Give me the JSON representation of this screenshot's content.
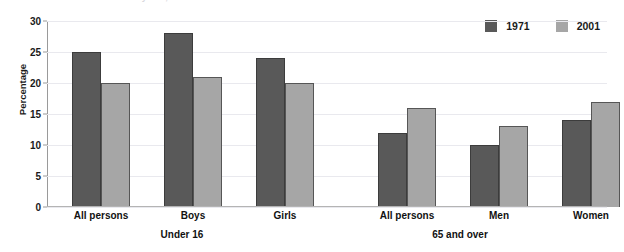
{
  "chart_data": {
    "type": "bar",
    "title": "",
    "xlabel": "",
    "ylabel": "Percentage",
    "ylim": [
      0,
      30
    ],
    "yticks": [
      "0",
      "5",
      "10",
      "15",
      "20",
      "25",
      "30"
    ],
    "grid": true,
    "legend_position": "top-right",
    "categories": [
      "All persons",
      "Boys",
      "Girls",
      "All persons",
      "Men",
      "Women"
    ],
    "groups": [
      {
        "label": "Under 16",
        "categories": [
          "All persons",
          "Boys",
          "Girls"
        ]
      },
      {
        "label": "65 and over",
        "categories": [
          "All persons",
          "Men",
          "Women"
        ]
      }
    ],
    "series": [
      {
        "name": "1971",
        "color": "#595959",
        "values": [
          25,
          28,
          24,
          12,
          10,
          14
        ]
      },
      {
        "name": "2001",
        "color": "#a6a6a6",
        "values": [
          20,
          21,
          20,
          16,
          13,
          17
        ]
      }
    ]
  },
  "title_strip": {
    "text": "65 and over: by sex, 1971 and 2001"
  },
  "legend": {
    "items": [
      {
        "label": "1971",
        "color": "#595959"
      },
      {
        "label": "2001",
        "color": "#a6a6a6"
      }
    ]
  },
  "axes": {
    "y_title": "Percentage"
  }
}
